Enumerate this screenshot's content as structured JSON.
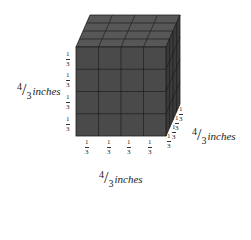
{
  "diagram": {
    "type": "cube-of-unit-cubes",
    "divisions_per_edge": 4,
    "unit_cube_edge": {
      "numerator": "1",
      "denominator": "3"
    },
    "colors": {
      "front": "#4a4a4a",
      "top": "#575757",
      "side": "#3a3a3a",
      "grid": "#1e1e1e",
      "text": "#222222"
    },
    "dimensions": {
      "height": {
        "numerator": "4",
        "denominator": "3",
        "unit": "inches"
      },
      "depth": {
        "numerator": "4",
        "denominator": "3",
        "unit": "inches"
      },
      "width": {
        "numerator": "4",
        "denominator": "3",
        "unit": "inches"
      }
    },
    "left_edge_labels": [
      {
        "n": "1",
        "d": "3"
      },
      {
        "n": "1",
        "d": "3"
      },
      {
        "n": "1",
        "d": "3"
      },
      {
        "n": "1",
        "d": "3"
      }
    ],
    "bottom_edge_labels": [
      {
        "n": "1",
        "d": "3"
      },
      {
        "n": "1",
        "d": "3"
      },
      {
        "n": "1",
        "d": "3"
      },
      {
        "n": "1",
        "d": "3"
      }
    ],
    "depth_edge_labels": [
      {
        "n": "1",
        "d": "3"
      },
      {
        "n": "1",
        "d": "3"
      },
      {
        "n": "1",
        "d": "3"
      },
      {
        "n": "1",
        "d": "3"
      }
    ]
  }
}
